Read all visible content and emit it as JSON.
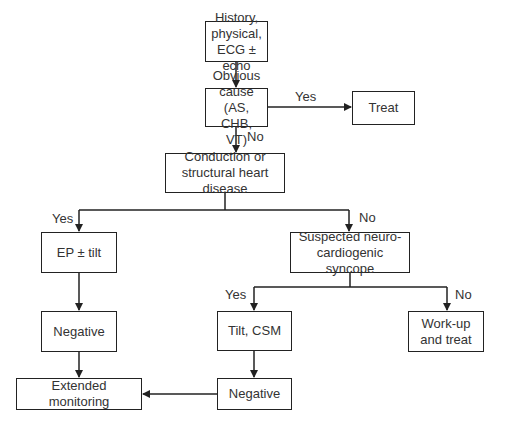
{
  "diagram": {
    "type": "flowchart",
    "nodes": {
      "start": "History, physical, ECG ± echo",
      "obvious_cause": "Obvious cause (AS, CHB, VT)",
      "treat": "Treat",
      "conduction": "Conduction or structural heart disease",
      "ep_tilt": "EP ± tilt",
      "suspected": "Suspected neuro-cardiogenic syncope",
      "negative_left": "Negative",
      "tilt_csm": "Tilt, CSM",
      "workup": "Work-up and treat",
      "extended": "Extended monitoring",
      "negative_right": "Negative"
    },
    "edge_labels": {
      "obvious_yes": "Yes",
      "obvious_no": "No",
      "conduction_yes": "Yes",
      "conduction_no": "No",
      "suspected_yes": "Yes",
      "suspected_no": "No"
    },
    "edges": [
      {
        "from": "start",
        "to": "obvious_cause",
        "label": ""
      },
      {
        "from": "obvious_cause",
        "to": "treat",
        "label": "Yes"
      },
      {
        "from": "obvious_cause",
        "to": "conduction",
        "label": "No"
      },
      {
        "from": "conduction",
        "to": "ep_tilt",
        "label": "Yes"
      },
      {
        "from": "conduction",
        "to": "suspected",
        "label": "No"
      },
      {
        "from": "ep_tilt",
        "to": "negative_left",
        "label": ""
      },
      {
        "from": "negative_left",
        "to": "extended",
        "label": ""
      },
      {
        "from": "suspected",
        "to": "tilt_csm",
        "label": "Yes"
      },
      {
        "from": "suspected",
        "to": "workup",
        "label": "No"
      },
      {
        "from": "tilt_csm",
        "to": "negative_right",
        "label": ""
      },
      {
        "from": "negative_right",
        "to": "extended",
        "label": ""
      }
    ],
    "colors": {
      "line": "#222222",
      "text": "#333333",
      "background": "#ffffff"
    }
  }
}
